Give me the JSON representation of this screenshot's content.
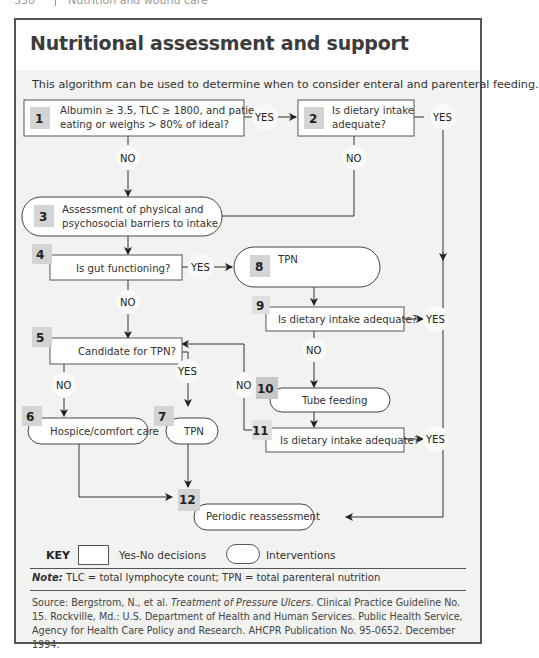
{
  "running_head": {
    "page": "330",
    "chapter": "Nutrition and wound care"
  },
  "title": "Nutritional assessment and support",
  "intro": "This algorithm can be used to determine when to consider enteral and parenteral feeding.",
  "nodes": [
    {
      "id": 1,
      "type": "decision",
      "lines": [
        "Albumin ≥ 3.5, TLC ≥ 1800, and patient",
        "eating or weighs > 80% of ideal?"
      ]
    },
    {
      "id": 2,
      "type": "decision",
      "lines": [
        "Is dietary intake",
        "adequate?"
      ]
    },
    {
      "id": 3,
      "type": "intervention",
      "lines": [
        "Assessment of physical and",
        "psychosocial barriers to intake"
      ]
    },
    {
      "id": 4,
      "type": "decision",
      "lines": [
        "Is gut functioning?"
      ]
    },
    {
      "id": 5,
      "type": "decision",
      "lines": [
        "Candidate for TPN?"
      ]
    },
    {
      "id": 6,
      "type": "intervention",
      "lines": [
        "Hospice/comfort care"
      ]
    },
    {
      "id": 7,
      "type": "intervention",
      "lines": [
        "TPN"
      ]
    },
    {
      "id": 8,
      "type": "intervention",
      "lines": [
        "Oral nutritional supplements",
        "and assistance"
      ]
    },
    {
      "id": 9,
      "type": "decision",
      "lines": [
        "Is dietary intake adequate?"
      ]
    },
    {
      "id": 10,
      "type": "intervention",
      "lines": [
        "Tube feeding"
      ]
    },
    {
      "id": 11,
      "type": "decision",
      "lines": [
        "Is dietary intake adequate?"
      ]
    },
    {
      "id": 12,
      "type": "intervention",
      "lines": [
        "Periodic reassessment"
      ]
    }
  ],
  "edges": [
    {
      "from": 1,
      "to": 2,
      "label": "YES"
    },
    {
      "from": 1,
      "to": 3,
      "label": "NO"
    },
    {
      "from": 2,
      "to": 12,
      "label": "YES"
    },
    {
      "from": 2,
      "to": 3,
      "label": "NO"
    },
    {
      "from": 3,
      "to": 4,
      "label": ""
    },
    {
      "from": 4,
      "to": 8,
      "label": "YES"
    },
    {
      "from": 4,
      "to": 5,
      "label": "NO"
    },
    {
      "from": 5,
      "to": 6,
      "label": "NO"
    },
    {
      "from": 5,
      "to": 7,
      "label": "YES"
    },
    {
      "from": 6,
      "to": 12,
      "label": ""
    },
    {
      "from": 7,
      "to": 12,
      "label": ""
    },
    {
      "from": 8,
      "to": 9,
      "label": ""
    },
    {
      "from": 9,
      "to": 12,
      "label": "YES"
    },
    {
      "from": 9,
      "to": 10,
      "label": "NO"
    },
    {
      "from": 10,
      "to": 11,
      "label": ""
    },
    {
      "from": 11,
      "to": 12,
      "label": "YES"
    },
    {
      "from": 11,
      "to": 5,
      "label": "NO"
    }
  ],
  "labels": {
    "yes": "YES",
    "no": "NO"
  },
  "key": {
    "title": "KEY",
    "decision_label": "Yes-No decisions",
    "intervention_label": "Interventions"
  },
  "note": {
    "prefix": "Note:",
    "text": " TLC = total lymphocyte count; TPN = total parenteral nutrition"
  },
  "source": {
    "prefix": "Source: Bergstrom, N., et al. ",
    "title": "Treatment of Pressure Ulcers",
    "rest": ". Clinical Practice Guideline No. 15. Rockville, Md.: U.S. Department of Health and Human Services. Public Health Service, Agency for Health Care Policy and Research. AHCPR Publication No. 95-0652. December 1994."
  },
  "colors": {
    "frame_border": "#555555",
    "panel_bg": "#f2f2f1",
    "badge_bg": "#d4d4d4",
    "line": "#333333"
  }
}
